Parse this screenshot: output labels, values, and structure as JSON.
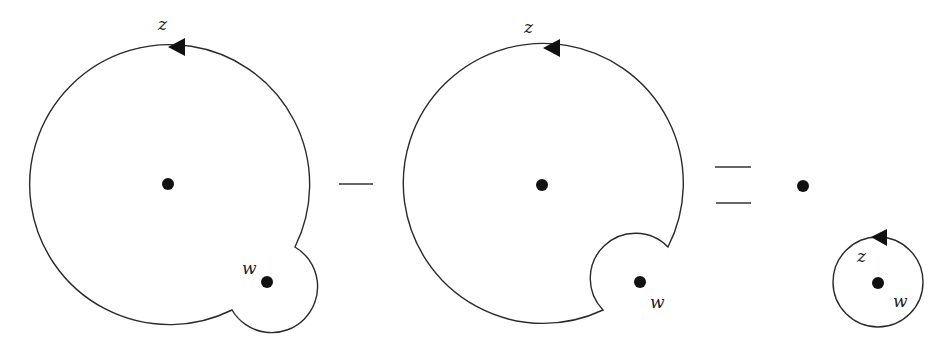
{
  "figure": {
    "panels": [
      {
        "id": "outer-with-bump",
        "contour_label": "z",
        "point_label": "w",
        "center_point": {
          "x": 168,
          "y": 184
        },
        "w_point": {
          "x": 267,
          "y": 282
        },
        "orientation": "counterclockwise"
      },
      {
        "id": "outer-with-indent",
        "contour_label": "z",
        "point_label": "w",
        "center_point": {
          "x": 542,
          "y": 185
        },
        "w_point": {
          "x": 640,
          "y": 282
        },
        "orientation": "counterclockwise"
      },
      {
        "id": "small-circle",
        "contour_label": "z",
        "point_label": "w",
        "center_point": {
          "x": 803,
          "y": 186
        },
        "w_point": {
          "x": 878,
          "y": 283
        },
        "orientation": "counterclockwise"
      }
    ],
    "operators": {
      "minus": "−",
      "equals": "="
    },
    "colors": {
      "stroke": "#2a2a2a",
      "fill_dots": "#111111",
      "background": "#ffffff"
    }
  }
}
